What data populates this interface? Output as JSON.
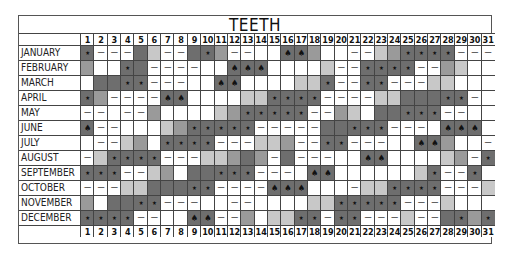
{
  "chart_data": {
    "type": "heatmap",
    "title": "TEETH",
    "xlabel": "",
    "ylabel": "",
    "x": [
      1,
      2,
      3,
      4,
      5,
      6,
      7,
      8,
      9,
      10,
      11,
      12,
      13,
      14,
      15,
      16,
      17,
      18,
      19,
      20,
      21,
      22,
      23,
      24,
      25,
      26,
      27,
      28,
      29,
      30,
      31
    ],
    "categories": [
      "JANUARY",
      "FEBRUARY",
      "MARCH",
      "APRIL",
      "MAY",
      "JUNE",
      "JULY",
      "AUGUST",
      "SEPTEMBER",
      "OCTOBER",
      "NOVEMBER",
      "DECEMBER"
    ],
    "legend": {
      "shades": {
        "0": "white",
        "1": "light gray",
        "2": "mid gray",
        "3": "dark gray"
      },
      "symbols": {
        "-": "dash",
        "*": "dot/star",
        "^": "spade",
        "": "none"
      }
    },
    "encoding": "each cell = shade digit + optional symbol",
    "rows": [
      "3* 0- 0- 0- 3 1 0- 0- 3 3* 2 0- 0- 0 0 3^ 3^ 2 0 0 0- 0- 1 2 3* 3* 3* 3* 0- 0- 0-",
      "2 0 0 3* 3 0- 0- 0- 0- 0 0 3^ 3^ 3^ 0 0 0 0 1 0- 0- 3* 3* 3* 3* 0- 0- 2 1 0 0",
      "0 3 3 3* 3* 0- 0- 0- 0 0 3^ 3^ 0 0 0 0 1 1 3* 0- 0- 3* 3* 0- 0- 0- 1 1 0 0 0",
      "3* 2 0- 0- 0- 0- 3^ 3^ 0 0 0 0 1 1 3* 3* 3* 3* 0- 0- 0- 0- 1 1 3 3 3 3* 3* 0- 0",
      "0- 0- 0 0- 0- 2 0 0 0 0 1 2 3* 3* 3* 3* 3* 0- 0- 2 1 0 3 3 3* 3* 3* 0- 0- 0 0",
      "3^ 0- 0- 0 0 0 1 2 3* 3* 3* 3* 3* 0- 0- 0- 0- 0- 3 3 3* 3* 3* 0- 0- 0- 0 3^ 3^ 3^ 0",
      "0 0- 0- 1 2 0 3* 3* 3* 3* 0- 0- 0- 1 1 2 0- 0- 3* 3* 0- 0- 0- 0 0 3^ 3^ 2 0 0 0-",
      "0- 1 3* 3* 3* 3* 0- 0- 0- 1 1 2 3 2 0- 3 0- 0- 0- 0 0 3^ 3^ 0 0 0 0 1 2 0- 3*",
      "3* 3* 3* 0- 0- 1 2 0 3 3 3* 3* 3* 0- 0- 0- 0 3^ 3^ 0 0 0 0 0 0 1 3* 0- 0- 3* 0",
      "0- 0- 0- 1 1 3 3 3 3* 3* 0- 0- 0- 0- 3^ 3^ 3^ 0 0 0 0- 1 1 3* 3* 3* 3* 0- 0- 0- 1",
      "2 0 3 3 3* 3* 0- 0- 0- 0 0 0- 0- 0 0 0 0 1 1 3* 3* 3* 3* 3* 0- 0- 0- 1 0 0 0",
      "3* 3* 3* 3* 0- 0- 0 0 3^ 3^ 0- 0- 2 0 1 1 3* 3* 0- 3* 3* 0- 0- 0- 1 0- 0- 3 3* 2 3*"
    ]
  }
}
